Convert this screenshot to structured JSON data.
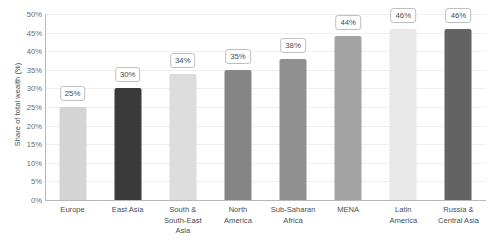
{
  "chart_data": {
    "type": "bar",
    "title": "",
    "xlabel": "",
    "ylabel": "Share of total wealth (%)",
    "ylim": [
      0,
      50
    ],
    "grid": true,
    "legend": "none",
    "ytick_labels": [
      "50%",
      "45%",
      "40%",
      "35%",
      "30%",
      "25%",
      "20%",
      "15%",
      "10%",
      "5%",
      "0%"
    ],
    "ytick_values": [
      50,
      45,
      40,
      35,
      30,
      25,
      20,
      15,
      10,
      5,
      0
    ],
    "categories": [
      "Europe",
      "East Asia",
      "South & South-East Asia",
      "North America",
      "Sub-Saharan Africa",
      "MENA",
      "Latin America",
      "Russia & Central Asia"
    ],
    "category_lines": [
      [
        "Europe"
      ],
      [
        "East Asia"
      ],
      [
        "South &",
        "South-East",
        "Asia"
      ],
      [
        "North",
        "America"
      ],
      [
        "Sub-Saharan",
        "Africa"
      ],
      [
        "MENA"
      ],
      [
        "Latin",
        "America"
      ],
      [
        "Russia &",
        "Central Asia"
      ]
    ],
    "values": [
      25,
      30,
      34,
      35,
      38,
      44,
      46,
      46
    ],
    "data_labels": [
      "25%",
      "30%",
      "34%",
      "35%",
      "38%",
      "44%",
      "46%",
      "46%"
    ],
    "bar_colors": [
      "#d4d4d4",
      "#3a3a3a",
      "#dcdcdc",
      "#858585",
      "#8f8f8f",
      "#a3a3a3",
      "#e8e8e8",
      "#636363"
    ]
  },
  "style": {
    "axis_color": "#b8b8b8",
    "gridline_color": "#f0f0f0",
    "text_color": "#4d4d4d",
    "tick_color": "#6b6b6b",
    "label_box_border": "#bfbfbf",
    "label_box_fill": "#ffffff",
    "background": "#ffffff"
  }
}
